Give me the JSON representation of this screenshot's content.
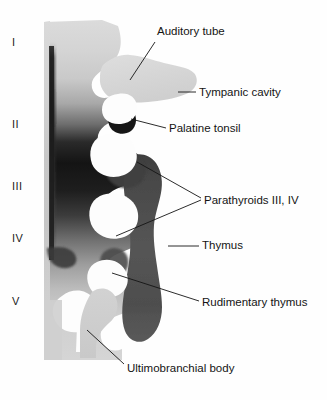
{
  "figure": {
    "width": 327,
    "height": 400,
    "background_color": "#fefefe",
    "ink_color": "#141414"
  },
  "pouch_numerals": [
    {
      "label": "I",
      "x": 12,
      "y": 36
    },
    {
      "label": "II",
      "x": 12,
      "y": 118
    },
    {
      "label": "III",
      "x": 12,
      "y": 180
    },
    {
      "label": "IV",
      "x": 12,
      "y": 232
    },
    {
      "label": "V",
      "x": 12,
      "y": 295
    }
  ],
  "callouts": [
    {
      "name": "auditory-tube",
      "label": "Auditory tube",
      "text_x": 157,
      "text_y": 25,
      "leader": {
        "x1": 155,
        "y1": 42,
        "x2": 130,
        "y2": 80
      }
    },
    {
      "name": "tympanic-cavity",
      "label": "Tympanic cavity",
      "text_x": 199,
      "text_y": 86,
      "leader": {
        "x1": 178,
        "y1": 92,
        "x2": 196,
        "y2": 92
      }
    },
    {
      "name": "palatine-tonsil",
      "label": "Palatine tonsil",
      "text_x": 169,
      "text_y": 122,
      "leader": {
        "x1": 131,
        "y1": 119,
        "x2": 166,
        "y2": 128
      }
    },
    {
      "name": "parathyroids-3-4",
      "label": "Parathyroids III, IV",
      "text_x": 204,
      "text_y": 194,
      "leader_a": {
        "x1": 137,
        "y1": 162,
        "x2": 201,
        "y2": 200
      },
      "leader_b": {
        "x1": 116,
        "y1": 236,
        "x2": 201,
        "y2": 200
      }
    },
    {
      "name": "thymus",
      "label": "Thymus",
      "text_x": 202,
      "text_y": 239,
      "leader": {
        "x1": 168,
        "y1": 246,
        "x2": 199,
        "y2": 246
      }
    },
    {
      "name": "rudimentary-thymus",
      "label": "Rudimentary thymus",
      "text_x": 202,
      "text_y": 296,
      "leader": {
        "x1": 112,
        "y1": 273,
        "x2": 199,
        "y2": 302
      }
    },
    {
      "name": "ultimobranchial-body",
      "label": "Ultimobranchial body",
      "text_x": 127,
      "text_y": 362,
      "leader": {
        "x1": 87,
        "y1": 330,
        "x2": 124,
        "y2": 364
      }
    }
  ],
  "palette": {
    "pale_gray": "#d3d3d3",
    "light_gray": "#c2c2c2",
    "mid_gray": "#9a9a9a",
    "dark_gray": "#4a4a4a",
    "near_black": "#161616",
    "shape_light": "#d6d6d6",
    "shape_dark": "#474747",
    "white": "#ffffff"
  }
}
